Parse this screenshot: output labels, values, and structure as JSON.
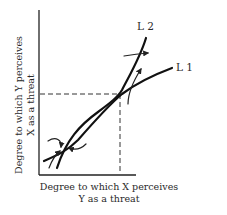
{
  "diagram": {
    "y_axis_label_line1": "Degree to which Y perceives",
    "y_axis_label_line2": "X as a threat",
    "x_axis_label_line1": "Degree to which X perceives",
    "x_axis_label_line2": "Y as a threat",
    "curves": [
      {
        "name": "L 2",
        "description": "steeper reaction curve"
      },
      {
        "name": "L 1",
        "description": "flatter reaction curve"
      }
    ],
    "equilibria": [
      {
        "description": "upper intersection of L1 and L2, marked by dashed projections to both axes",
        "stable": false
      },
      {
        "description": "lower intersection of L1 and L2 near origin, arrows converge",
        "stable": true
      }
    ]
  }
}
